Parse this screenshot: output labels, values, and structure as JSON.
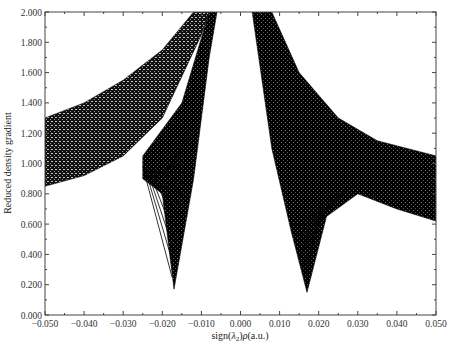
{
  "chart_data": {
    "type": "scatter",
    "title": "",
    "xlabel": "sign(λ2)ρ(a.u.)",
    "ylabel": "Reduced density gradient",
    "xlim": [
      -0.05,
      0.05
    ],
    "ylim": [
      0.0,
      2.0
    ],
    "x_ticks": [
      -0.05,
      -0.04,
      -0.03,
      -0.02,
      -0.01,
      0.0,
      0.01,
      0.02,
      0.03,
      0.04,
      0.05
    ],
    "x_tick_labels": [
      "−0.050",
      "−0.040",
      "−0.030",
      "−0.020",
      "−0.010",
      "0.000",
      "0.010",
      "0.020",
      "0.030",
      "0.040",
      "0.050"
    ],
    "y_ticks": [
      0.0,
      0.2,
      0.4,
      0.6,
      0.8,
      1.0,
      1.2,
      1.4,
      1.6,
      1.8,
      2.0
    ],
    "y_tick_labels": [
      "0.000",
      "0.200",
      "0.400",
      "0.600",
      "0.800",
      "1.000",
      "1.200",
      "1.400",
      "1.600",
      "1.800",
      "2.000"
    ],
    "grid": false,
    "legend": null,
    "marker_color": "#000000",
    "regions": [
      {
        "name": "left-outer-band",
        "upper_edge": [
          [
            -0.05,
            1.3
          ],
          [
            -0.04,
            1.4
          ],
          [
            -0.03,
            1.55
          ],
          [
            -0.02,
            1.75
          ],
          [
            -0.012,
            2.0
          ]
        ],
        "lower_edge": [
          [
            -0.05,
            0.85
          ],
          [
            -0.04,
            0.92
          ],
          [
            -0.03,
            1.05
          ],
          [
            -0.02,
            1.3
          ],
          [
            -0.01,
            1.85
          ],
          [
            -0.008,
            2.0
          ]
        ]
      },
      {
        "name": "left-inner-spike",
        "upper_edge": [
          [
            -0.025,
            1.05
          ],
          [
            -0.015,
            1.4
          ],
          [
            -0.008,
            2.0
          ],
          [
            -0.006,
            2.0
          ]
        ],
        "lower_edge": [
          [
            -0.025,
            0.9
          ],
          [
            -0.02,
            0.8
          ],
          [
            -0.017,
            0.17
          ],
          [
            -0.012,
            0.9
          ],
          [
            -0.008,
            1.7
          ],
          [
            -0.006,
            2.0
          ]
        ],
        "minimum": {
          "x": -0.017,
          "y": 0.17
        }
      },
      {
        "name": "right-band",
        "upper_edge": [
          [
            0.008,
            2.0
          ],
          [
            0.015,
            1.6
          ],
          [
            0.025,
            1.3
          ],
          [
            0.035,
            1.15
          ],
          [
            0.05,
            1.05
          ]
        ],
        "lower_edge": [
          [
            0.003,
            2.0
          ],
          [
            0.008,
            1.1
          ],
          [
            0.013,
            0.55
          ],
          [
            0.017,
            0.15
          ],
          [
            0.022,
            0.65
          ],
          [
            0.03,
            0.8
          ],
          [
            0.04,
            0.7
          ],
          [
            0.05,
            0.62
          ]
        ],
        "minimum": {
          "x": 0.017,
          "y": 0.15
        }
      }
    ]
  }
}
